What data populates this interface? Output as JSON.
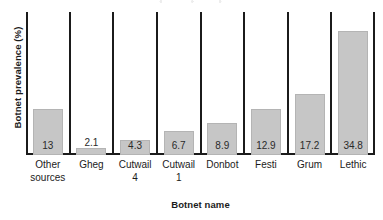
{
  "chart_data": {
    "type": "bar",
    "title": "",
    "xlabel": "Botnet name",
    "ylabel": "Botnet prevalence (%)",
    "categories": [
      "Other sources",
      "Gheg",
      "Cutwail 4",
      "Cutwail 1",
      "Donbot",
      "Festi",
      "Grum",
      "Lethic"
    ],
    "category_lines": [
      [
        "Other",
        "sources"
      ],
      [
        "Gheg",
        ""
      ],
      [
        "Cutwail",
        "4"
      ],
      [
        "Cutwail",
        "1"
      ],
      [
        "Donbot",
        ""
      ],
      [
        "Festi",
        ""
      ],
      [
        "Grum",
        ""
      ],
      [
        "Lethic",
        ""
      ]
    ],
    "values": [
      13,
      2.1,
      4.3,
      6.7,
      8.9,
      12.9,
      17.2,
      34.8
    ],
    "value_labels": [
      "13",
      "2.1",
      "4.3",
      "6.7",
      "8.9",
      "12.9",
      "17.2",
      "34.8"
    ],
    "label_placement": [
      "inside",
      "above",
      "inside",
      "inside",
      "inside",
      "inside",
      "inside",
      "inside"
    ],
    "ylim": [
      0,
      40
    ],
    "grid": false,
    "legend": null,
    "bar_color": "#c6c6c6",
    "axis_color": "#1b1b1b",
    "text_color": "#1b1b1b",
    "separators_between_categories": true
  }
}
